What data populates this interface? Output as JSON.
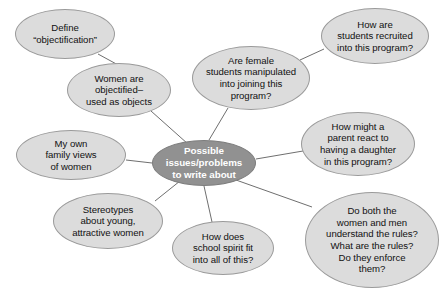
{
  "diagram": {
    "type": "cluster-web-diagram",
    "title": "Possible issues/problems to write about",
    "colors": {
      "node_fill": "#dcdcdc",
      "node_stroke": "#9a9a9a",
      "hub_fill": "#919191",
      "hub_stroke": "#7d7d7d",
      "hub_text": "#ffffff",
      "node_text": "#111111",
      "edge_stroke": "#6f6f6f",
      "background": "#ffffff"
    },
    "hub": {
      "id": "hub",
      "label": "Possible\nissues/problems\nto write about",
      "cx": 204,
      "cy": 163,
      "rx": 52,
      "ry": 23
    },
    "nodes": [
      {
        "id": "define-objectification",
        "label": "Define\n“objectification”",
        "cx": 65,
        "cy": 34,
        "rx": 50,
        "ry": 25,
        "connects_to": "women-objectified"
      },
      {
        "id": "women-objectified",
        "label": "Women are\nobjectified–\nused as objects",
        "cx": 119,
        "cy": 90,
        "rx": 52,
        "ry": 27,
        "connects_to": "hub"
      },
      {
        "id": "female-students-manipulated",
        "label": "Are female\nstudents manipulated\ninto joining this\nprogram?",
        "cx": 251,
        "cy": 78,
        "rx": 59,
        "ry": 32,
        "connects_to": "hub"
      },
      {
        "id": "students-recruited",
        "label": "How are\nstudents recruited\ninto this program?",
        "cx": 375,
        "cy": 36,
        "rx": 54,
        "ry": 28,
        "connects_to": "female-students-manipulated"
      },
      {
        "id": "parent-react",
        "label": "How might a\nparent react to\nhaving a daughter\nin this program?",
        "cx": 358,
        "cy": 144,
        "rx": 57,
        "ry": 32,
        "connects_to": "hub"
      },
      {
        "id": "rules-enforcement",
        "label": "Do both the\nwomen and men\nunderstand the rules?\nWhat are the rules?\nDo they enforce\nthem?",
        "cx": 372,
        "cy": 240,
        "rx": 67,
        "ry": 48,
        "connects_to": "hub"
      },
      {
        "id": "school-spirit",
        "label": "How does\nschool spirit fit\ninto all of this?",
        "cx": 223,
        "cy": 248,
        "rx": 51,
        "ry": 27,
        "connects_to": "hub"
      },
      {
        "id": "stereotypes",
        "label": "Stereotypes\nabout young,\nattractive women",
        "cx": 108,
        "cy": 221,
        "rx": 55,
        "ry": 28,
        "connects_to": "hub"
      },
      {
        "id": "family-views",
        "label": "My own\nfamily views\nof women",
        "cx": 71,
        "cy": 155,
        "rx": 55,
        "ry": 25,
        "connects_to": "hub"
      }
    ],
    "edges": [
      {
        "id": "edge-define-to-women",
        "x1": 98,
        "y1": 54,
        "x2": 120,
        "y2": 66
      },
      {
        "id": "edge-women-to-hub",
        "x1": 151,
        "y1": 111,
        "x2": 188,
        "y2": 144
      },
      {
        "id": "edge-female-to-hub",
        "x1": 228,
        "y1": 108,
        "x2": 209,
        "y2": 140
      },
      {
        "id": "edge-recruited-to-female",
        "x1": 324,
        "y1": 49,
        "x2": 300,
        "y2": 60
      },
      {
        "id": "edge-parent-to-hub",
        "x1": 303,
        "y1": 151,
        "x2": 256,
        "y2": 159
      },
      {
        "id": "edge-rules-to-hub",
        "x1": 312,
        "y1": 207,
        "x2": 236,
        "y2": 180
      },
      {
        "id": "edge-spirit-to-hub",
        "x1": 212,
        "y1": 222,
        "x2": 204,
        "y2": 186
      },
      {
        "id": "edge-stereotypes-to-hub",
        "x1": 155,
        "y1": 201,
        "x2": 180,
        "y2": 181
      },
      {
        "id": "edge-family-to-hub",
        "x1": 126,
        "y1": 160,
        "x2": 152,
        "y2": 163
      }
    ]
  }
}
